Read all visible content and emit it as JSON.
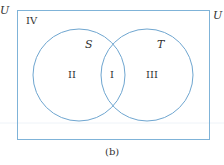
{
  "diagram": {
    "type": "venn",
    "universe_label": "U",
    "left_partial_label": "U",
    "sets": [
      {
        "name": "S",
        "cx": 79,
        "cy": 75,
        "r": 46
      },
      {
        "name": "T",
        "cx": 147,
        "cy": 75,
        "r": 46
      }
    ],
    "regions": [
      {
        "label": "I",
        "meaning": "S ∩ T"
      },
      {
        "label": "II",
        "meaning": "S only"
      },
      {
        "label": "III",
        "meaning": "T only"
      },
      {
        "label": "IV",
        "meaning": "outside S and T"
      }
    ],
    "caption": "(b)",
    "colors": {
      "line": "#5b9bd5",
      "text": "#333333",
      "background": "#ffffff"
    }
  }
}
